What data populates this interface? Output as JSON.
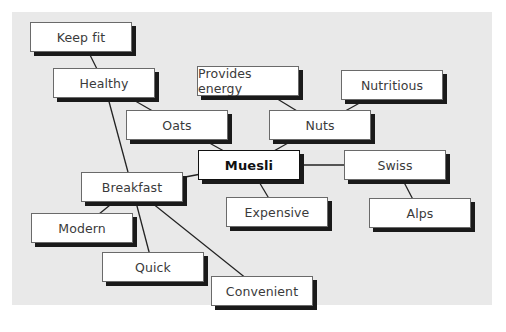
{
  "diagram": {
    "type": "mind-map",
    "center": "Muesli",
    "nodes": [
      {
        "id": "keepfit",
        "label": "Keep fit",
        "x": 30,
        "y": 22
      },
      {
        "id": "healthy",
        "label": "Healthy",
        "x": 53,
        "y": 68
      },
      {
        "id": "energy",
        "label": "Provides energy",
        "x": 197,
        "y": 66
      },
      {
        "id": "nutritious",
        "label": "Nutritious",
        "x": 341,
        "y": 70
      },
      {
        "id": "oats",
        "label": "Oats",
        "x": 126,
        "y": 110
      },
      {
        "id": "nuts",
        "label": "Nuts",
        "x": 269,
        "y": 110
      },
      {
        "id": "muesli",
        "label": "Muesli",
        "x": 198,
        "y": 150,
        "center": true
      },
      {
        "id": "swiss",
        "label": "Swiss",
        "x": 344,
        "y": 150
      },
      {
        "id": "breakfast",
        "label": "Breakfast",
        "x": 81,
        "y": 172
      },
      {
        "id": "expensive",
        "label": "Expensive",
        "x": 226,
        "y": 197
      },
      {
        "id": "alps",
        "label": "Alps",
        "x": 369,
        "y": 198
      },
      {
        "id": "modern",
        "label": "Modern",
        "x": 31,
        "y": 213
      },
      {
        "id": "quick",
        "label": "Quick",
        "x": 102,
        "y": 252
      },
      {
        "id": "convenient",
        "label": "Convenient",
        "x": 211,
        "y": 276
      }
    ],
    "edges": [
      [
        "keepfit",
        "healthy"
      ],
      [
        "healthy",
        "oats"
      ],
      [
        "healthy",
        "breakfast"
      ],
      [
        "oats",
        "muesli"
      ],
      [
        "energy",
        "nuts"
      ],
      [
        "nutritious",
        "nuts"
      ],
      [
        "nuts",
        "muesli"
      ],
      [
        "muesli",
        "swiss"
      ],
      [
        "swiss",
        "alps"
      ],
      [
        "muesli",
        "expensive"
      ],
      [
        "muesli",
        "breakfast"
      ],
      [
        "breakfast",
        "modern"
      ],
      [
        "breakfast",
        "quick"
      ],
      [
        "breakfast",
        "convenient"
      ]
    ],
    "colors": {
      "panel": "#e9e9e9",
      "box": "#ffffff",
      "shadow": "#1a1a1a",
      "line": "#222222"
    }
  }
}
